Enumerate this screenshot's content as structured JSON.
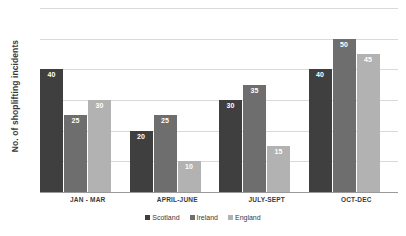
{
  "chart_data": {
    "type": "bar",
    "title": "",
    "xlabel": "",
    "ylabel": "No. of shoplifting incidents",
    "categories": [
      "JAN - MAR",
      "APRIL-JUNE",
      "JULY-SEPT",
      "OCT-DEC"
    ],
    "series": [
      {
        "name": "Scotland",
        "color": "#3f3f3f",
        "values": [
          40,
          20,
          30,
          40
        ]
      },
      {
        "name": "Ireland",
        "color": "#6e6e6e",
        "values": [
          25,
          25,
          35,
          50
        ]
      },
      {
        "name": "England",
        "color": "#b2b2b2",
        "values": [
          30,
          10,
          15,
          45
        ]
      }
    ],
    "ylim": [
      0,
      60
    ],
    "y_tick_interval": 10,
    "y_tick_labels_visible": false,
    "grid": true,
    "legend_position": "bottom"
  },
  "colors": {
    "background": "#ffffff",
    "gridline": "#d9d9d9",
    "axis_line": "#9a9a9a",
    "text": "#3a3a3a",
    "bar_label_text": "#ffffff"
  }
}
